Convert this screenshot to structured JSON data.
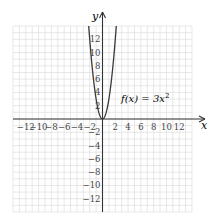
{
  "chart_data": {
    "type": "line",
    "title": "",
    "function_label": "f(x) = 3x²",
    "function_label_main": "f(x) = 3x",
    "function_label_exp": "2",
    "xlabel": "x",
    "ylabel": "y",
    "xlim": [
      -14,
      14
    ],
    "ylim": [
      -14,
      14
    ],
    "grid": true,
    "grid_step": 1,
    "x_ticks": [
      -12,
      -10,
      -8,
      -6,
      -4,
      -2,
      2,
      4,
      6,
      8,
      10,
      12
    ],
    "x_tick_labels": [
      "−12",
      "−10",
      "−8",
      "−6",
      "−4",
      "−2",
      "2",
      "4",
      "6",
      "8",
      "10",
      "12"
    ],
    "y_ticks": [
      12,
      10,
      8,
      6,
      4,
      2,
      -2,
      -4,
      -6,
      -8,
      -10,
      -12
    ],
    "y_tick_labels": [
      "12",
      "10",
      "8",
      "6",
      "4",
      "2",
      "−2",
      "−4",
      "−6",
      "−8",
      "−10",
      "−12"
    ],
    "series": [
      {
        "name": "f(x) = 3x^2",
        "x": [
          -2.16,
          -2,
          -1.5,
          -1,
          -0.5,
          0,
          0.5,
          1,
          1.5,
          2,
          2.16
        ],
        "y": [
          14,
          12,
          6.75,
          3,
          0.75,
          0,
          0.75,
          3,
          6.75,
          12,
          14
        ]
      }
    ]
  },
  "colors": {
    "grid": "#d9d9d9",
    "axis": "#333333",
    "curve": "#3a3a3a",
    "text": "#444444"
  }
}
